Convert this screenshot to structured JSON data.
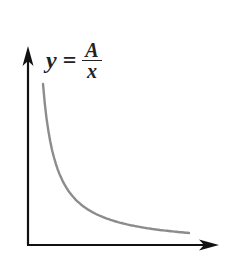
{
  "chart_data": {
    "type": "line",
    "equation": {
      "lhs": "y",
      "equals": "=",
      "numerator": "A",
      "denominator": "x"
    },
    "xlabel": "",
    "ylabel": "",
    "grid": false,
    "legend": "none",
    "axes": {
      "x_arrow": true,
      "y_arrow": true,
      "ticks": false
    },
    "series": [
      {
        "name": "y = A/x",
        "color": "#8c8c8c",
        "x": [
          1,
          1.5,
          2,
          3,
          4,
          5,
          6,
          8,
          10,
          12
        ],
        "values": [
          12,
          8,
          6,
          4,
          3,
          2.4,
          2,
          1.5,
          1.2,
          1.0
        ]
      }
    ]
  },
  "colors": {
    "axis": "#111111",
    "curve": "#8c8c8c",
    "text": "#222222"
  }
}
